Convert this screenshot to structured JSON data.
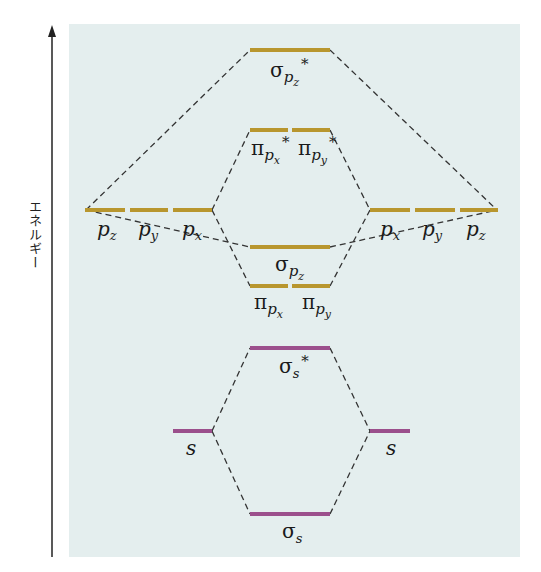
{
  "diagram": {
    "type": "molecular-orbital-energy-diagram",
    "axis": {
      "label": "エネルギー",
      "direction": "up"
    },
    "colors": {
      "background_panel": "#e4eeee",
      "p_level": "#b8962e",
      "s_level": "#9b4f8c",
      "connector": "#333333",
      "axis": "#222222"
    },
    "atomic_orbitals_left": [
      {
        "id": "pz-left",
        "label": "p",
        "sub": "z"
      },
      {
        "id": "py-left",
        "label": "p",
        "sub": "y"
      },
      {
        "id": "px-left",
        "label": "p",
        "sub": "x"
      },
      {
        "id": "s-left",
        "label": "s",
        "sub": ""
      }
    ],
    "atomic_orbitals_right": [
      {
        "id": "px-right",
        "label": "p",
        "sub": "x"
      },
      {
        "id": "py-right",
        "label": "p",
        "sub": "y"
      },
      {
        "id": "pz-right",
        "label": "p",
        "sub": "z"
      },
      {
        "id": "s-right",
        "label": "s",
        "sub": ""
      }
    ],
    "molecular_orbitals": [
      {
        "id": "sigma-pz-star",
        "label": "σ",
        "sub": "p",
        "subsub": "z",
        "star": "*"
      },
      {
        "id": "pi-px-star",
        "label": "π",
        "sub": "p",
        "subsub": "x",
        "star": "*"
      },
      {
        "id": "pi-py-star",
        "label": "π",
        "sub": "p",
        "subsub": "y",
        "star": "*"
      },
      {
        "id": "sigma-pz",
        "label": "σ",
        "sub": "p",
        "subsub": "z",
        "star": ""
      },
      {
        "id": "pi-px",
        "label": "π",
        "sub": "p",
        "subsub": "x",
        "star": ""
      },
      {
        "id": "pi-py",
        "label": "π",
        "sub": "p",
        "subsub": "y",
        "star": ""
      },
      {
        "id": "sigma-s-star",
        "label": "σ",
        "sub": "s",
        "subsub": "",
        "star": "*"
      },
      {
        "id": "sigma-s",
        "label": "σ",
        "sub": "s",
        "subsub": "",
        "star": ""
      }
    ]
  }
}
